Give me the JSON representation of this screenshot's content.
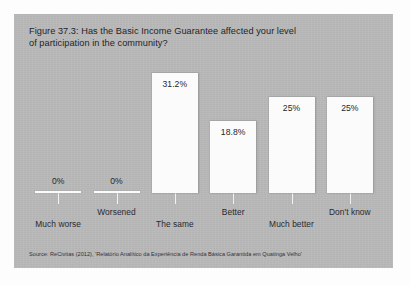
{
  "figure": {
    "title": "Figure 37.3: Has the Basic Income Guarantee affected your level\nof participation in the community?",
    "source": "Source: ReCivitas (2012), 'Relatório Analítico da Experiência de Renda Básica Garantida em Quatinga Velho'",
    "panel_color": "#b9b9b9",
    "bar_color": "#fbfbfb",
    "text_color": "#24242a"
  },
  "chart_data": {
    "type": "bar",
    "title": "Figure 37.3: Has the Basic Income Guarantee affected your level of participation in the community?",
    "categories": [
      "Much worse",
      "Worsened",
      "The same",
      "Better",
      "Much better",
      "Don't know"
    ],
    "values": [
      0,
      0,
      31.2,
      18.8,
      25,
      25
    ],
    "value_labels": [
      "0%",
      "0%",
      "31.2%",
      "18.8%",
      "25%",
      "25%"
    ],
    "xlabel": "",
    "ylabel": "",
    "ylim": [
      0,
      35
    ],
    "grid": false,
    "legend": false,
    "axis": "x-axis baseline with downward ticks at each category; category labels staggered on two rows"
  }
}
